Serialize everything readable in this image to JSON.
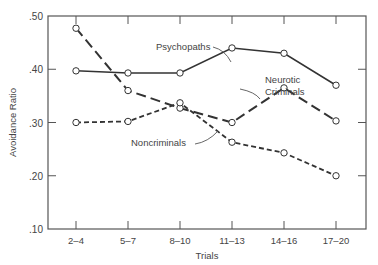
{
  "chart_data": {
    "type": "line",
    "title": "",
    "xlabel": "Trials",
    "ylabel": "Avoidance Ratio",
    "categories": [
      "2–4",
      "5–7",
      "8–10",
      "11–13",
      "14–16",
      "17–20"
    ],
    "yticks": [
      ".10",
      ".20",
      ".30",
      ".40",
      ".50"
    ],
    "ylim": [
      0.1,
      0.5
    ],
    "grid": false,
    "legend": "inline annotations",
    "series": [
      {
        "name": "Psychopaths",
        "style": "solid",
        "values": [
          0.397,
          0.393,
          0.393,
          0.44,
          0.43,
          0.37
        ]
      },
      {
        "name": "Neurotic Criminals",
        "style": "long-dash",
        "values": [
          0.477,
          0.36,
          0.327,
          0.3,
          0.365,
          0.303
        ]
      },
      {
        "name": "Noncriminals",
        "style": "short-dash",
        "values": [
          0.3,
          0.302,
          0.337,
          0.263,
          0.243,
          0.2
        ]
      }
    ],
    "annotations": [
      {
        "text": "Psychopaths",
        "x": 156,
        "y": 50
      },
      {
        "text": "Neurotic",
        "x": 265,
        "y": 83
      },
      {
        "text": "Criminals",
        "x": 265,
        "y": 95
      },
      {
        "text": "Noncriminals",
        "x": 131,
        "y": 146
      }
    ]
  }
}
